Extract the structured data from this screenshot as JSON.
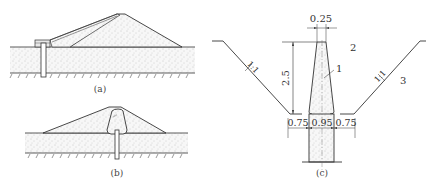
{
  "figure": {
    "panels": [
      {
        "id": "a",
        "caption": "(a)",
        "description": "Embankment cross-section with cutoff wall at upstream toe connected to sloping blanket"
      },
      {
        "id": "b",
        "caption": "(b)",
        "description": "Embankment cross-section with central core and cutoff wall below"
      },
      {
        "id": "c",
        "caption": "(c)",
        "description": "Trench section of cutoff wall with dimensions",
        "dimensions": {
          "top_width": "0.25",
          "height": "2.5",
          "bottom_left": "0.75",
          "bottom_center": "0.95",
          "bottom_right": "0.75"
        },
        "slopes": {
          "left": "1:1",
          "right": "1:1"
        },
        "labels": {
          "one": "1",
          "two": "2",
          "three": "3"
        }
      }
    ]
  },
  "colors": {
    "line": "#333333",
    "fill": "#f2f2f2",
    "stipple": "#999999"
  }
}
